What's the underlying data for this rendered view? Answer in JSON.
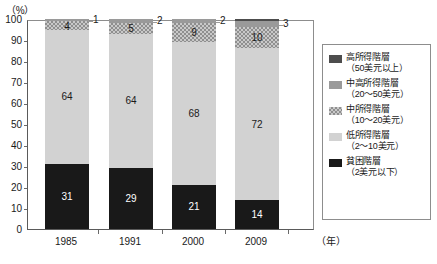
{
  "chart_data": {
    "type": "bar",
    "subtype": "stacked-100-percent",
    "title": "",
    "xlabel": "(年)",
    "ylabel": "(%)",
    "ylim": [
      0,
      100
    ],
    "ytick_step": 10,
    "grid": false,
    "legend_position": "right",
    "categories": [
      "1985",
      "1991",
      "2000",
      "2009"
    ],
    "yticks": [
      "0",
      "10",
      "20",
      "30",
      "40",
      "50",
      "60",
      "70",
      "80",
      "90",
      "100"
    ],
    "series": [
      {
        "name": "貧困階層",
        "range": "（2美元以下）",
        "color": "#191919",
        "pattern": "solid",
        "values": [
          31,
          29,
          21,
          14
        ],
        "labels": [
          "31",
          "29",
          "21",
          "14"
        ],
        "label_inside": true
      },
      {
        "name": "低所得階層",
        "range": "（2〜10美元）",
        "color": "#d2d2d2",
        "pattern": "solid",
        "values": [
          64,
          64,
          68,
          72
        ],
        "labels": [
          "64",
          "64",
          "68",
          "72"
        ],
        "label_inside": true
      },
      {
        "name": "中所得階層",
        "range": "（10〜20美元）",
        "color": "#c9c9c9",
        "pattern": "checker",
        "values": [
          4,
          5,
          9,
          10
        ],
        "labels": [
          "4",
          "5",
          "9",
          "10"
        ],
        "label_inside": true
      },
      {
        "name": "中高所得階層",
        "range": "（20〜50美元）",
        "color": "#9a9a9a",
        "pattern": "solid",
        "values": [
          1,
          2,
          2,
          3
        ],
        "labels": [
          "1",
          "2",
          "2",
          "3"
        ],
        "label_inside": false
      },
      {
        "name": "高所得階層",
        "range": "（50美元以上）",
        "color": "#4d4d4d",
        "pattern": "solid",
        "values": [
          0,
          0,
          0,
          1
        ],
        "labels": [
          "",
          "",
          "",
          ""
        ],
        "label_inside": false
      }
    ]
  },
  "axis": {
    "unit_y": "（%）",
    "unit_x": "（年）"
  },
  "legend": {
    "items": [
      {
        "label": "高所得階層",
        "range": "（50美元以上）",
        "swatch": "high"
      },
      {
        "label": "中高所得階層",
        "range": "（20〜50美元）",
        "swatch": "upmid"
      },
      {
        "label": "中所得階層",
        "range": "（10〜20美元）",
        "swatch": "mid"
      },
      {
        "label": "低所得階層",
        "range": "（2〜10美元）",
        "swatch": "low"
      },
      {
        "label": "貧困階層",
        "range": "（2美元以下）",
        "swatch": "poor"
      }
    ]
  }
}
